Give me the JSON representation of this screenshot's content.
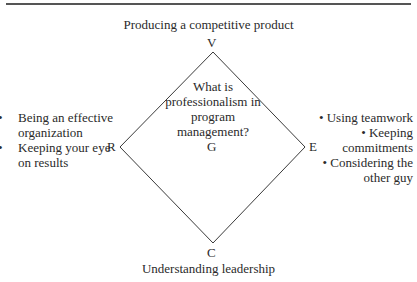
{
  "diagram": {
    "title_top": "Producing a competitive product",
    "title_bottom": "Understanding leadership",
    "vertices": {
      "top": "V",
      "left": "R",
      "right": "E",
      "bottom": "C",
      "center": "G"
    },
    "center_question": "What is professionalism in program management?",
    "left_items": [
      "Being an effective organization",
      "Keeping your eye on results"
    ],
    "right_items": [
      "Using teamwork",
      "Keeping commitments",
      "Considering the other guy"
    ],
    "bullet_glyph": "•",
    "line_color": "#3a3a3a"
  }
}
